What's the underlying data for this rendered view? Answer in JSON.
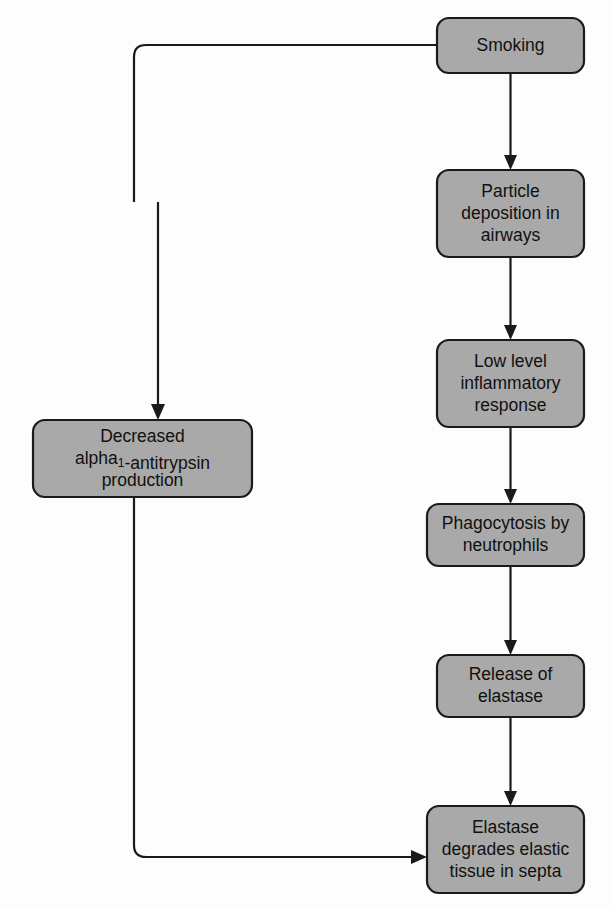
{
  "diagram": {
    "type": "flowchart",
    "background_color": "#fdfdfd",
    "node_fill_color": "#a9a9a9",
    "node_border_color": "#1a1a1a",
    "text_color": "#101010",
    "nodes": [
      {
        "id": "smoking",
        "lines": [
          "Smoking"
        ],
        "x": 437,
        "y": 18,
        "w": 147,
        "h": 55,
        "r": 12
      },
      {
        "id": "particle_deposition",
        "lines": [
          "Particle",
          "deposition in",
          "airways"
        ],
        "x": 437,
        "y": 170,
        "w": 147,
        "h": 87,
        "r": 12
      },
      {
        "id": "inflammatory_response",
        "lines": [
          "Low level",
          "inflammatory",
          "response"
        ],
        "x": 437,
        "y": 340,
        "w": 147,
        "h": 87,
        "r": 12
      },
      {
        "id": "phagocytosis",
        "lines": [
          "Phagocytosis by",
          "neutrophils"
        ],
        "x": 427,
        "y": 504,
        "w": 157,
        "h": 62,
        "r": 12
      },
      {
        "id": "release_elastase",
        "lines": [
          "Release of",
          "elastase"
        ],
        "x": 437,
        "y": 655,
        "w": 147,
        "h": 62,
        "r": 12
      },
      {
        "id": "elastase_degrades",
        "lines": [
          "Elastase",
          "degrades elastic",
          "tissue in septa"
        ],
        "x": 427,
        "y": 806,
        "w": 157,
        "h": 87,
        "r": 12
      },
      {
        "id": "decreased_antitrypsin",
        "lines": [
          "Decreased",
          "alpha|1|-antitrypsin",
          "production"
        ],
        "x": 33,
        "y": 420,
        "w": 219,
        "h": 77,
        "r": 12
      }
    ],
    "edges": [
      {
        "id": "smoking-to-particle",
        "from": "smoking",
        "to": "particle_deposition",
        "path": "M 510.5 73 L 510.5 162",
        "arrow": "M 510.5 170 L 504 155 L 517 155 Z"
      },
      {
        "id": "particle-to-inflammatory",
        "from": "particle_deposition",
        "to": "inflammatory_response",
        "path": "M 510.5 257 L 510.5 332",
        "arrow": "M 510.5 340 L 504 325 L 517 325 Z"
      },
      {
        "id": "inflammatory-to-phagocytosis",
        "from": "inflammatory_response",
        "to": "phagocytosis",
        "path": "M 510.5 427 L 510.5 496",
        "arrow": "M 510.5 504 L 504 489 L 517 489 Z"
      },
      {
        "id": "phagocytosis-to-release",
        "from": "phagocytosis",
        "to": "release_elastase",
        "path": "M 510.5 566 L 510.5 647",
        "arrow": "M 510.5 655 L 504 640 L 517 640 Z"
      },
      {
        "id": "release-to-degrades",
        "from": "release_elastase",
        "to": "elastase_degrades",
        "path": "M 510.5 717 L 510.5 798",
        "arrow": "M 510.5 806 L 504 791 L 517 791 Z"
      },
      {
        "id": "smoking-to-antitrypsin",
        "from": "smoking",
        "to": "decreased_antitrypsin",
        "path": "M 437 45 L 146 45 Q 134 45 134 57 L 134 202 M 158 202 L 158 412",
        "arrow": "M 158 420 L 151 404 L 165 404 Z"
      },
      {
        "id": "antitrypsin-to-degrades",
        "from": "decreased_antitrypsin",
        "to": "elastase_degrades",
        "path": "M 134 497 L 134 845 Q 134 857 146 857 L 419 857",
        "arrow": "M 427 857 L 411 850 L 411 864 Z"
      }
    ]
  }
}
